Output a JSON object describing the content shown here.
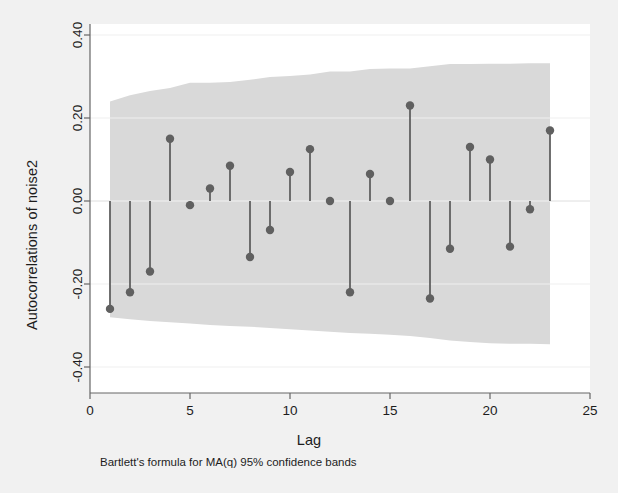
{
  "chart_data": {
    "type": "scatter",
    "title": "",
    "xlabel": "Lag",
    "ylabel": "Autocorrelations of noise2",
    "note": "Bartlett's formula for MA(q) 95% confidence bands",
    "xlim": [
      0,
      25
    ],
    "ylim": [
      -0.4,
      0.4
    ],
    "xticks": [
      0,
      5,
      10,
      15,
      20,
      25
    ],
    "xtick_labels": [
      "0",
      "5",
      "10",
      "15",
      "20",
      "25"
    ],
    "yticks": [
      -0.4,
      -0.2,
      0.0,
      0.2,
      0.4
    ],
    "ytick_labels": [
      "-0.40",
      "-0.20",
      "0.00",
      "0.20",
      "0.40"
    ],
    "grid": false,
    "legend": "none",
    "marker_color": "#606060",
    "stem_color": "#606060",
    "band_color": "#d9d9d9",
    "baseline": 0.0,
    "x": [
      1,
      2,
      3,
      4,
      5,
      6,
      7,
      8,
      9,
      10,
      11,
      12,
      13,
      14,
      15,
      16,
      17,
      18,
      19,
      20,
      21,
      22,
      23
    ],
    "values": [
      -0.26,
      -0.22,
      -0.17,
      0.15,
      -0.01,
      0.03,
      0.085,
      -0.135,
      -0.07,
      0.07,
      0.125,
      0.0,
      -0.22,
      0.065,
      0.0,
      0.23,
      -0.235,
      -0.115,
      0.13,
      0.1,
      -0.11,
      -0.02,
      0.17
    ],
    "confidence_band": {
      "label": "95% confidence band",
      "upper": [
        0.24,
        0.255,
        0.265,
        0.272,
        0.285,
        0.285,
        0.287,
        0.292,
        0.299,
        0.301,
        0.305,
        0.312,
        0.312,
        0.318,
        0.319,
        0.319,
        0.325,
        0.33,
        0.33,
        0.331,
        0.331,
        0.332,
        0.332
      ],
      "lower": [
        -0.28,
        -0.285,
        -0.289,
        -0.292,
        -0.295,
        -0.299,
        -0.301,
        -0.303,
        -0.306,
        -0.309,
        -0.312,
        -0.315,
        -0.318,
        -0.32,
        -0.322,
        -0.325,
        -0.33,
        -0.336,
        -0.34,
        -0.343,
        -0.344,
        -0.344,
        -0.345
      ]
    }
  }
}
